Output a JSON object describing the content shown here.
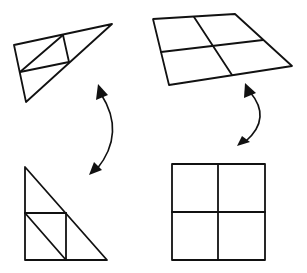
{
  "diagram": {
    "description": "Transformation diagram showing distorted shapes mapped to their canonical forms",
    "stroke_color": "#111111",
    "background_color": "#ffffff",
    "shapes": [
      {
        "id": "distorted-triangle",
        "position": "top-left",
        "type": "triangle subdivided into square and triangles (skewed)",
        "outline": [
          [
            14,
            45
          ],
          [
            112,
            24
          ],
          [
            26,
            102
          ]
        ],
        "inner_lines": [
          [
            [
              63,
              35
            ],
            [
              69,
              62
            ]
          ],
          [
            [
              20,
              72
            ],
            [
              69,
              62
            ]
          ],
          [
            [
              20,
              72
            ],
            [
              63,
              35
            ]
          ]
        ]
      },
      {
        "id": "distorted-grid",
        "position": "top-right",
        "type": "2x2 grid quadrilateral (perspective-skewed)",
        "outline": [
          [
            153,
            19
          ],
          [
            235,
            14
          ],
          [
            292,
            66
          ],
          [
            169,
            85
          ]
        ],
        "inner_lines": [
          [
            [
              194,
              17
            ],
            [
              232,
              75
            ]
          ],
          [
            [
              161,
              52
            ],
            [
              263,
              40
            ]
          ]
        ]
      },
      {
        "id": "canonical-triangle",
        "position": "bottom-left",
        "type": "right triangle with inscribed square and diagonal",
        "outline": [
          [
            25,
            167
          ],
          [
            25,
            260
          ],
          [
            107,
            260
          ]
        ],
        "inner_lines": [
          [
            [
              25,
              213
            ],
            [
              66,
              213
            ]
          ],
          [
            [
              66,
              213
            ],
            [
              66,
              260
            ]
          ],
          [
            [
              25,
              213
            ],
            [
              66,
              260
            ]
          ]
        ]
      },
      {
        "id": "canonical-grid",
        "position": "bottom-right",
        "type": "2x2 square grid",
        "outline": [
          [
            172,
            164
          ],
          [
            265,
            164
          ],
          [
            265,
            260
          ],
          [
            172,
            260
          ]
        ],
        "inner_lines": [
          [
            [
              218,
              164
            ],
            [
              218,
              260
            ]
          ],
          [
            [
              172,
              212
            ],
            [
              265,
              212
            ]
          ]
        ]
      }
    ],
    "arrows": [
      {
        "id": "left-double-arrow",
        "connects": [
          "distorted-triangle",
          "canonical-triangle"
        ],
        "type": "curved bidirectional",
        "path": "M 101 92 Q 125 135 95 172"
      },
      {
        "id": "right-double-arrow",
        "connects": [
          "distorted-grid",
          "canonical-grid"
        ],
        "type": "curved bidirectional",
        "path": "M 249 88 Q 272 118 243 144"
      }
    ]
  }
}
